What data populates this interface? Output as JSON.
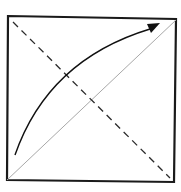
{
  "diagram": {
    "type": "origami-fold",
    "colors": {
      "background": "#ffffff",
      "outline": "#1a1a1a",
      "dashed_line": "#2a2a2a",
      "crease_line": "#a8a8a8",
      "arrow": "#111111"
    },
    "square": {
      "corners": [
        [
          8,
          16
        ],
        [
          176,
          19
        ],
        [
          174,
          182
        ],
        [
          7,
          180
        ]
      ]
    },
    "dashed_diagonal": {
      "from": [
        13,
        22
      ],
      "to": [
        170,
        178
      ]
    },
    "crease_diagonal": {
      "from": [
        7,
        180
      ],
      "to": [
        176,
        20
      ]
    },
    "fold_arrow": {
      "from": [
        15,
        155
      ],
      "control": [
        50,
        55
      ],
      "to": [
        158,
        25
      ]
    }
  }
}
